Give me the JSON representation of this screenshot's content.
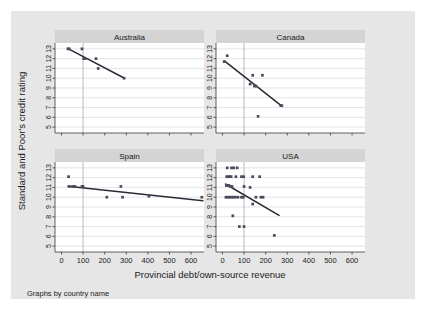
{
  "figure": {
    "background_color": "#e6e6e6",
    "plot_background_color": "#ffffff",
    "strip_background_color": "#d4d4d4",
    "marker_color": "#4a4a5a",
    "line_color": "#2b2b33",
    "grid_color": "#d9d9e0",
    "reference_line_x": 100,
    "footer": "Graphs by country name"
  },
  "chart_data": {
    "type": "scatter",
    "title": "",
    "xlabel": "Provincial debt/own-source revenue",
    "ylabel": "Standard and Poor's credit rating",
    "xlim": [
      -30,
      660
    ],
    "ylim": [
      4.4,
      13.6
    ],
    "xticks": [
      0,
      100,
      200,
      300,
      400,
      500,
      600
    ],
    "yticks": [
      5,
      6,
      7,
      8,
      9,
      10,
      11,
      12,
      13
    ],
    "xtick_labels": [
      "0",
      "100",
      "200",
      "300",
      "400",
      "500",
      "600"
    ],
    "ytick_labels": [
      "5",
      "6",
      "7",
      "8",
      "9",
      "10",
      "11",
      "12",
      "13"
    ],
    "grid": true,
    "grid_axis": "y",
    "legend": "none",
    "facet_by": "country name",
    "annotations": [
      {
        "type": "vline",
        "x": 100,
        "label": "reference line at 100"
      }
    ],
    "panels": [
      {
        "name": "Australia",
        "row": 0,
        "col": 0,
        "points": [
          {
            "x": 30,
            "y": 13.0
          },
          {
            "x": 36,
            "y": 13.0
          },
          {
            "x": 95,
            "y": 13.0
          },
          {
            "x": 103,
            "y": 12.0
          },
          {
            "x": 110,
            "y": 12.0
          },
          {
            "x": 160,
            "y": 12.0
          },
          {
            "x": 170,
            "y": 11.0
          },
          {
            "x": 290,
            "y": 10.0
          }
        ],
        "fit_line": {
          "x1": 28,
          "y1": 13.05,
          "x2": 292,
          "y2": 10.0
        }
      },
      {
        "name": "Canada",
        "row": 0,
        "col": 1,
        "points": [
          {
            "x": 22,
            "y": 12.3
          },
          {
            "x": 8,
            "y": 11.7
          },
          {
            "x": 140,
            "y": 10.3
          },
          {
            "x": 185,
            "y": 10.3
          },
          {
            "x": 128,
            "y": 9.4
          },
          {
            "x": 148,
            "y": 9.2
          },
          {
            "x": 155,
            "y": 9.2
          },
          {
            "x": 270,
            "y": 7.2
          },
          {
            "x": 275,
            "y": 7.2
          },
          {
            "x": 165,
            "y": 6.1
          }
        ],
        "fit_line": {
          "x1": 10,
          "y1": 11.75,
          "x2": 272,
          "y2": 7.2
        }
      },
      {
        "name": "Spain",
        "row": 1,
        "col": 0,
        "points": [
          {
            "x": 33,
            "y": 12.1
          },
          {
            "x": 36,
            "y": 11.1
          },
          {
            "x": 52,
            "y": 11.1
          },
          {
            "x": 62,
            "y": 11.1
          },
          {
            "x": 95,
            "y": 11.1
          },
          {
            "x": 100,
            "y": 11.1
          },
          {
            "x": 210,
            "y": 10.0
          },
          {
            "x": 275,
            "y": 11.1
          },
          {
            "x": 283,
            "y": 10.0
          },
          {
            "x": 405,
            "y": 10.1
          },
          {
            "x": 650,
            "y": 10.0
          }
        ],
        "fit_line": {
          "x1": 30,
          "y1": 11.12,
          "x2": 655,
          "y2": 9.65
        }
      },
      {
        "name": "USA",
        "row": 1,
        "col": 1,
        "points": [
          {
            "x": 22,
            "y": 13.0
          },
          {
            "x": 42,
            "y": 13.0
          },
          {
            "x": 52,
            "y": 13.0
          },
          {
            "x": 68,
            "y": 13.0
          },
          {
            "x": 20,
            "y": 12.1
          },
          {
            "x": 26,
            "y": 12.1
          },
          {
            "x": 33,
            "y": 12.1
          },
          {
            "x": 40,
            "y": 12.1
          },
          {
            "x": 62,
            "y": 12.1
          },
          {
            "x": 88,
            "y": 12.1
          },
          {
            "x": 98,
            "y": 12.1
          },
          {
            "x": 140,
            "y": 12.1
          },
          {
            "x": 172,
            "y": 12.1
          },
          {
            "x": 18,
            "y": 11.2
          },
          {
            "x": 24,
            "y": 11.2
          },
          {
            "x": 30,
            "y": 11.2
          },
          {
            "x": 36,
            "y": 11.1
          },
          {
            "x": 44,
            "y": 11.1
          },
          {
            "x": 100,
            "y": 11.1
          },
          {
            "x": 128,
            "y": 11.0
          },
          {
            "x": 16,
            "y": 10.0
          },
          {
            "x": 24,
            "y": 10.0
          },
          {
            "x": 32,
            "y": 10.0
          },
          {
            "x": 40,
            "y": 10.0
          },
          {
            "x": 50,
            "y": 10.0
          },
          {
            "x": 60,
            "y": 10.0
          },
          {
            "x": 72,
            "y": 10.0
          },
          {
            "x": 88,
            "y": 10.0
          },
          {
            "x": 96,
            "y": 10.0
          },
          {
            "x": 155,
            "y": 10.0
          },
          {
            "x": 178,
            "y": 10.0
          },
          {
            "x": 188,
            "y": 10.0
          },
          {
            "x": 140,
            "y": 9.3
          },
          {
            "x": 48,
            "y": 8.1
          },
          {
            "x": 78,
            "y": 7.0
          },
          {
            "x": 100,
            "y": 7.0
          },
          {
            "x": 240,
            "y": 6.1
          }
        ],
        "fit_line": {
          "x1": 14,
          "y1": 11.35,
          "x2": 262,
          "y2": 8.15
        }
      }
    ]
  }
}
